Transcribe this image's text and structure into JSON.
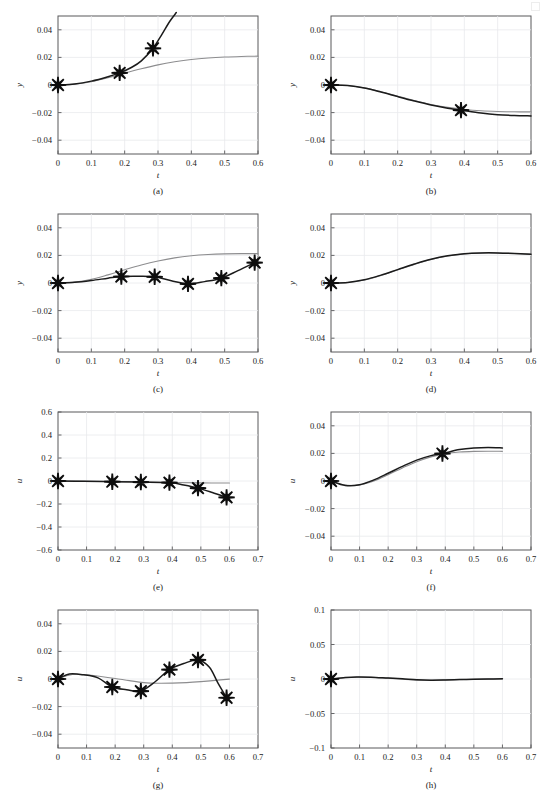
{
  "figure": {
    "width": 546,
    "height": 795,
    "columns": 2,
    "rows": 4,
    "colors": {
      "main_series": "#1b1b1b",
      "reference_series": "#8d8d8f",
      "grid": "#e9eaec",
      "frame": "#58585a",
      "marker": "#0d0d0d",
      "background": "#ffffff"
    },
    "marker_style": "asterisk-8-spoke"
  },
  "chart_data": [
    {
      "id": "a",
      "type": "line",
      "caption": "(a)",
      "title": "",
      "xlabel": "t",
      "ylabel": "y",
      "xlim": [
        0,
        0.6
      ],
      "ylim": [
        -0.05,
        0.05
      ],
      "xticks": [
        0,
        0.1,
        0.2,
        0.3,
        0.4,
        0.5,
        0.6
      ],
      "xticklabels": [
        "0",
        "0.1",
        "0.2",
        "0.3",
        "0.4",
        "0.5",
        "0.6"
      ],
      "yticks": [
        -0.04,
        -0.02,
        0,
        0.02,
        0.04
      ],
      "yticklabels": [
        "-0.04",
        "-0.02",
        "0",
        "0.02",
        "0.04"
      ],
      "grid": true,
      "legend": "none",
      "series": [
        {
          "name": "reference",
          "style": "gray-thin",
          "x": [
            0,
            0.05,
            0.1,
            0.15,
            0.2,
            0.25,
            0.3,
            0.35,
            0.4,
            0.45,
            0.5,
            0.55,
            0.6
          ],
          "y": [
            0.0,
            0.0006,
            0.0024,
            0.0052,
            0.0086,
            0.0118,
            0.0146,
            0.0168,
            0.0185,
            0.0196,
            0.0203,
            0.0207,
            0.0209
          ]
        },
        {
          "name": "estimate",
          "style": "black-thick",
          "x": [
            0,
            0.05,
            0.1,
            0.15,
            0.185,
            0.22,
            0.25,
            0.285,
            0.31,
            0.335,
            0.355
          ],
          "y": [
            0.0,
            0.0007,
            0.0028,
            0.006,
            0.0088,
            0.0127,
            0.0175,
            0.0266,
            0.036,
            0.046,
            0.0525
          ]
        }
      ],
      "markers": {
        "x": [
          0.0,
          0.185,
          0.285
        ],
        "y": [
          0.0,
          0.0088,
          0.0266
        ]
      }
    },
    {
      "id": "b",
      "type": "line",
      "caption": "(b)",
      "title": "",
      "xlabel": "t",
      "ylabel": "y",
      "xlim": [
        0,
        0.6
      ],
      "ylim": [
        -0.05,
        0.05
      ],
      "xticks": [
        0,
        0.1,
        0.2,
        0.3,
        0.4,
        0.5,
        0.6
      ],
      "xticklabels": [
        "0",
        "0.1",
        "0.2",
        "0.3",
        "0.4",
        "0.5",
        "0.6"
      ],
      "yticks": [
        -0.04,
        -0.02,
        0,
        0.02,
        0.04
      ],
      "yticklabels": [
        "-0.04",
        "-0.02",
        "0",
        "0.02",
        "0.04"
      ],
      "grid": true,
      "legend": "none",
      "series": [
        {
          "name": "reference",
          "style": "gray-thin",
          "x": [
            0,
            0.05,
            0.1,
            0.15,
            0.2,
            0.25,
            0.3,
            0.35,
            0.4,
            0.45,
            0.5,
            0.55,
            0.6
          ],
          "y": [
            0.0,
            -0.0004,
            -0.0021,
            -0.0049,
            -0.0081,
            -0.0113,
            -0.0141,
            -0.0162,
            -0.0177,
            -0.0187,
            -0.0192,
            -0.0194,
            -0.0195
          ]
        },
        {
          "name": "estimate",
          "style": "black-thick",
          "x": [
            0,
            0.05,
            0.1,
            0.15,
            0.2,
            0.25,
            0.3,
            0.35,
            0.39,
            0.45,
            0.5,
            0.55,
            0.6
          ],
          "y": [
            0.0,
            -0.0004,
            -0.0022,
            -0.0051,
            -0.0084,
            -0.0116,
            -0.0145,
            -0.0168,
            -0.0182,
            -0.0203,
            -0.0215,
            -0.0221,
            -0.0224
          ]
        }
      ],
      "markers": {
        "x": [
          0.0,
          0.39
        ],
        "y": [
          0.0,
          -0.0182
        ]
      }
    },
    {
      "id": "c",
      "type": "line",
      "caption": "(c)",
      "title": "",
      "xlabel": "t",
      "ylabel": "y",
      "xlim": [
        0,
        0.6
      ],
      "ylim": [
        -0.05,
        0.05
      ],
      "xticks": [
        0,
        0.1,
        0.2,
        0.3,
        0.4,
        0.5,
        0.6
      ],
      "xticklabels": [
        "0",
        "0.1",
        "0.2",
        "0.3",
        "0.4",
        "0.5",
        "0.6"
      ],
      "yticks": [
        -0.04,
        -0.02,
        0,
        0.02,
        0.04
      ],
      "yticklabels": [
        "-0.04",
        "-0.02",
        "0",
        "0.02",
        "0.04"
      ],
      "grid": true,
      "legend": "none",
      "series": [
        {
          "name": "reference",
          "style": "gray-thin",
          "x": [
            0,
            0.05,
            0.1,
            0.15,
            0.2,
            0.25,
            0.3,
            0.35,
            0.4,
            0.45,
            0.5,
            0.55,
            0.6
          ],
          "y": [
            0.0,
            0.0006,
            0.0026,
            0.0059,
            0.0096,
            0.0131,
            0.016,
            0.0182,
            0.0197,
            0.0206,
            0.0211,
            0.0213,
            0.0213
          ]
        },
        {
          "name": "estimate",
          "style": "black-thick",
          "x": [
            0,
            0.05,
            0.1,
            0.15,
            0.19,
            0.24,
            0.29,
            0.34,
            0.39,
            0.44,
            0.49,
            0.54,
            0.59
          ],
          "y": [
            0.0,
            0.0005,
            0.0018,
            0.0035,
            0.0047,
            0.0049,
            0.0045,
            0.0016,
            -0.0006,
            0.001,
            0.0035,
            0.009,
            0.0148
          ]
        }
      ],
      "markers": {
        "x": [
          0.0,
          0.19,
          0.29,
          0.39,
          0.49,
          0.59
        ],
        "y": [
          0.0,
          0.0047,
          0.0045,
          -0.0006,
          0.0035,
          0.0148
        ]
      }
    },
    {
      "id": "d",
      "type": "line",
      "caption": "(d)",
      "title": "",
      "xlabel": "t",
      "ylabel": "y",
      "xlim": [
        0,
        0.6
      ],
      "ylim": [
        -0.05,
        0.05
      ],
      "xticks": [
        0,
        0.1,
        0.2,
        0.3,
        0.4,
        0.5,
        0.6
      ],
      "xticklabels": [
        "0",
        "0.1",
        "0.2",
        "0.3",
        "0.4",
        "0.5",
        "0.6"
      ],
      "yticks": [
        -0.04,
        -0.02,
        0,
        0.02,
        0.04
      ],
      "yticklabels": [
        "-0.04",
        "-0.02",
        "0",
        "0.02",
        "0.04"
      ],
      "grid": true,
      "legend": "none",
      "series": [
        {
          "name": "reference",
          "style": "gray-thin",
          "x": [
            0,
            0.05,
            0.1,
            0.15,
            0.2,
            0.25,
            0.3,
            0.35,
            0.4,
            0.45,
            0.5,
            0.55,
            0.6
          ],
          "y": [
            0.0,
            0.0004,
            0.0022,
            0.0055,
            0.0095,
            0.0135,
            0.017,
            0.0196,
            0.0211,
            0.0217,
            0.0217,
            0.0214,
            0.0208
          ]
        },
        {
          "name": "estimate",
          "style": "black-thick",
          "x": [
            0,
            0.05,
            0.1,
            0.15,
            0.2,
            0.25,
            0.3,
            0.35,
            0.4,
            0.45,
            0.5,
            0.55,
            0.6
          ],
          "y": [
            0.0,
            0.0004,
            0.0023,
            0.0057,
            0.0097,
            0.0137,
            0.0172,
            0.0197,
            0.0212,
            0.0218,
            0.0218,
            0.0214,
            0.0208
          ]
        }
      ],
      "markers": {
        "x": [
          0.0
        ],
        "y": [
          0.0
        ]
      }
    },
    {
      "id": "e",
      "type": "line",
      "caption": "(e)",
      "title": "",
      "xlabel": "t",
      "ylabel": "u",
      "xlim": [
        0,
        0.7
      ],
      "ylim": [
        -0.6,
        0.6
      ],
      "xticks": [
        0,
        0.1,
        0.2,
        0.3,
        0.4,
        0.5,
        0.6,
        0.7
      ],
      "xticklabels": [
        "0",
        "0.1",
        "0.2",
        "0.3",
        "0.4",
        "0.5",
        "0.6",
        "0.7"
      ],
      "yticks": [
        -0.6,
        -0.4,
        -0.2,
        0,
        0.2,
        0.4,
        0.6
      ],
      "yticklabels": [
        "-0.6",
        "-0.4",
        "-0.2",
        "0",
        "0.2",
        "0.4",
        "0.6"
      ],
      "grid": true,
      "legend": "none",
      "series": [
        {
          "name": "reference",
          "style": "gray-thin",
          "x": [
            0,
            0.1,
            0.2,
            0.3,
            0.4,
            0.5,
            0.6
          ],
          "y": [
            0.0,
            -0.002,
            -0.005,
            -0.009,
            -0.013,
            -0.016,
            -0.018
          ]
        },
        {
          "name": "estimate",
          "style": "black-thick",
          "x": [
            0,
            0.09,
            0.19,
            0.29,
            0.39,
            0.44,
            0.49,
            0.54,
            0.59
          ],
          "y": [
            0.0,
            -0.003,
            -0.006,
            -0.009,
            -0.014,
            -0.035,
            -0.062,
            -0.1,
            -0.142
          ]
        }
      ],
      "markers": {
        "x": [
          0.0,
          0.19,
          0.29,
          0.39,
          0.49,
          0.59
        ],
        "y": [
          0.0,
          -0.006,
          -0.009,
          -0.014,
          -0.062,
          -0.142
        ]
      }
    },
    {
      "id": "f",
      "type": "line",
      "caption": "(f)",
      "title": "",
      "xlabel": "t",
      "ylabel": "u",
      "xlim": [
        0,
        0.7
      ],
      "ylim": [
        -0.05,
        0.05
      ],
      "xticks": [
        0,
        0.1,
        0.2,
        0.3,
        0.4,
        0.5,
        0.6,
        0.7
      ],
      "xticklabels": [
        "0",
        "0.1",
        "0.2",
        "0.3",
        "0.4",
        "0.5",
        "0.6",
        "0.7"
      ],
      "yticks": [
        -0.04,
        -0.02,
        0,
        0.02,
        0.04
      ],
      "yticklabels": [
        "-0.04",
        "-0.02",
        "0",
        "0.02",
        "0.04"
      ],
      "grid": true,
      "legend": "none",
      "series": [
        {
          "name": "reference",
          "style": "gray-thin",
          "x": [
            0,
            0.05,
            0.1,
            0.15,
            0.2,
            0.25,
            0.3,
            0.35,
            0.4,
            0.45,
            0.5,
            0.55,
            0.6
          ],
          "y": [
            0.0,
            -0.003,
            -0.0028,
            0.0001,
            0.0046,
            0.0095,
            0.014,
            0.0175,
            0.0198,
            0.021,
            0.0215,
            0.0216,
            0.0215
          ]
        },
        {
          "name": "estimate",
          "style": "black-thick",
          "x": [
            0,
            0.05,
            0.1,
            0.15,
            0.2,
            0.25,
            0.3,
            0.35,
            0.39,
            0.45,
            0.5,
            0.55,
            0.6
          ],
          "y": [
            0.0,
            -0.0032,
            -0.0027,
            0.0008,
            0.0056,
            0.0106,
            0.0151,
            0.0184,
            0.0199,
            0.0228,
            0.024,
            0.0243,
            0.024
          ]
        }
      ],
      "markers": {
        "x": [
          0.0,
          0.39
        ],
        "y": [
          0.0,
          0.0199
        ]
      }
    },
    {
      "id": "g",
      "type": "line",
      "caption": "(g)",
      "title": "",
      "xlabel": "t",
      "ylabel": "u",
      "xlim": [
        0,
        0.7
      ],
      "ylim": [
        -0.05,
        0.05
      ],
      "xticks": [
        0,
        0.1,
        0.2,
        0.3,
        0.4,
        0.5,
        0.6,
        0.7
      ],
      "xticklabels": [
        "0",
        "0.1",
        "0.2",
        "0.3",
        "0.4",
        "0.5",
        "0.6",
        "0.7"
      ],
      "yticks": [
        -0.04,
        -0.02,
        0,
        0.02,
        0.04
      ],
      "yticklabels": [
        "-0.04",
        "-0.02",
        "0",
        "0.02",
        "0.04"
      ],
      "grid": true,
      "legend": "none",
      "series": [
        {
          "name": "reference",
          "style": "gray-thin",
          "x": [
            0,
            0.05,
            0.1,
            0.15,
            0.2,
            0.25,
            0.3,
            0.35,
            0.4,
            0.45,
            0.5,
            0.55,
            0.6
          ],
          "y": [
            0.0,
            0.0032,
            0.003,
            0.0018,
            0.0004,
            -0.0012,
            -0.0026,
            -0.0031,
            -0.003,
            -0.0026,
            -0.0019,
            -0.001,
            -0.0001
          ]
        },
        {
          "name": "estimate",
          "style": "black-thick",
          "x": [
            0,
            0.04,
            0.09,
            0.14,
            0.19,
            0.24,
            0.29,
            0.34,
            0.39,
            0.44,
            0.49,
            0.53,
            0.56,
            0.59
          ],
          "y": [
            0.0,
            0.0036,
            0.003,
            0.0008,
            -0.0058,
            -0.0078,
            -0.0088,
            -0.002,
            0.0068,
            0.0112,
            0.0138,
            0.0085,
            -0.003,
            -0.0136
          ]
        }
      ],
      "markers": {
        "x": [
          0.0,
          0.19,
          0.29,
          0.39,
          0.49,
          0.59
        ],
        "y": [
          0.0,
          -0.0058,
          -0.0088,
          0.0068,
          0.0138,
          -0.0136
        ]
      }
    },
    {
      "id": "h",
      "type": "line",
      "caption": "(h)",
      "title": "",
      "xlabel": "t",
      "ylabel": "u",
      "xlim": [
        0,
        0.7
      ],
      "ylim": [
        -0.1,
        0.1
      ],
      "xticks": [
        0,
        0.1,
        0.2,
        0.3,
        0.4,
        0.5,
        0.6,
        0.7
      ],
      "xticklabels": [
        "0",
        "0.1",
        "0.2",
        "0.3",
        "0.4",
        "0.5",
        "0.6",
        "0.7"
      ],
      "yticks": [
        -0.1,
        -0.05,
        0,
        0.05,
        0.1
      ],
      "yticklabels": [
        "-0.1",
        "-0.05",
        "0",
        "0.05",
        "0.1"
      ],
      "grid": true,
      "legend": "none",
      "series": [
        {
          "name": "reference",
          "style": "gray-thin",
          "x": [
            0,
            0.1,
            0.2,
            0.3,
            0.4,
            0.5,
            0.6
          ],
          "y": [
            0.0,
            0.0028,
            0.0012,
            -0.0016,
            -0.0012,
            -0.0004,
            0.0001
          ]
        },
        {
          "name": "estimate",
          "style": "black-thick",
          "x": [
            0,
            0.05,
            0.09,
            0.14,
            0.2,
            0.25,
            0.3,
            0.35,
            0.4,
            0.45,
            0.5,
            0.55,
            0.6
          ],
          "y": [
            0.0,
            0.0022,
            0.003,
            0.0026,
            0.0013,
            0.0002,
            -0.0012,
            -0.0018,
            -0.0015,
            -0.0009,
            -0.0004,
            0.0,
            0.0002
          ]
        }
      ],
      "markers": {
        "x": [
          0.0
        ],
        "y": [
          0.0
        ]
      }
    }
  ]
}
